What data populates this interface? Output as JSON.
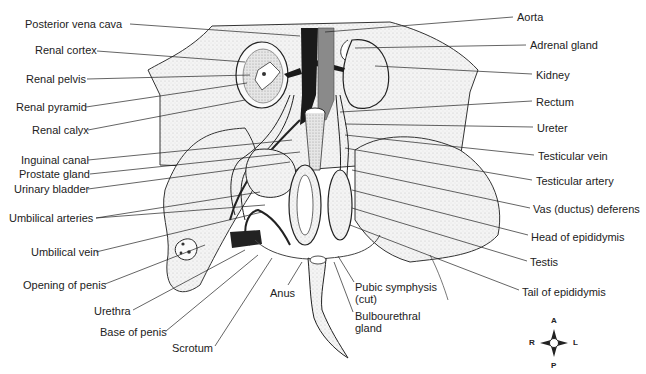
{
  "figure": {
    "labels_left": [
      {
        "id": "posterior-vena-cava",
        "text": "Posterior vena cava",
        "x": 25,
        "y": 18,
        "lx": 130,
        "ly": 24,
        "tx": 300,
        "ty": 36
      },
      {
        "id": "renal-cortex",
        "text": "Renal cortex",
        "x": 35,
        "y": 44,
        "lx": 97,
        "ly": 51,
        "tx": 245,
        "ty": 62
      },
      {
        "id": "renal-pelvis",
        "text": "Renal pelvis",
        "x": 26,
        "y": 73,
        "lx": 87,
        "ly": 79,
        "tx": 250,
        "ty": 75
      },
      {
        "id": "renal-pyramid",
        "text": "Renal pyramid",
        "x": 16,
        "y": 101,
        "lx": 86,
        "ly": 107,
        "tx": 247,
        "ty": 83
      },
      {
        "id": "renal-calyx",
        "text": "Renal calyx",
        "x": 32,
        "y": 124,
        "lx": 88,
        "ly": 130,
        "tx": 245,
        "ty": 100
      },
      {
        "id": "inguinal-canal",
        "text": "Inguinal canal",
        "x": 21,
        "y": 154,
        "lx": 88,
        "ly": 160,
        "tx": 292,
        "ty": 140
      },
      {
        "id": "prostate-gland",
        "text": "Prostate gland",
        "x": 19,
        "y": 168,
        "lx": 90,
        "ly": 174,
        "tx": 300,
        "ty": 152
      },
      {
        "id": "urinary-bladder",
        "text": "Urinary bladder",
        "x": 14,
        "y": 183,
        "lx": 88,
        "ly": 189,
        "tx": 290,
        "ty": 162
      },
      {
        "id": "umbilical-arteries",
        "text": "Umbilical arteries",
        "x": 9,
        "y": 212,
        "lx": 96,
        "ly": 218,
        "tx": 260,
        "ty": 192,
        "tx2": 265,
        "ty2": 205
      },
      {
        "id": "umbilical-vein",
        "text": "Umbilical vein",
        "x": 31,
        "y": 246,
        "lx": 96,
        "ly": 252,
        "tx": 262,
        "ty": 212
      },
      {
        "id": "opening-of-penis",
        "text": "Opening of penis",
        "x": 23,
        "y": 279,
        "lx": 105,
        "ly": 284,
        "tx": 205,
        "ty": 245
      },
      {
        "id": "urethra",
        "text": "Urethra",
        "x": 94,
        "y": 305,
        "lx": 133,
        "ly": 310,
        "tx": 245,
        "ty": 250
      },
      {
        "id": "base-of-penis",
        "text": "Base of penis",
        "x": 100,
        "y": 326,
        "lx": 166,
        "ly": 331,
        "tx": 258,
        "ty": 255
      },
      {
        "id": "scrotum",
        "text": "Scrotum",
        "x": 172,
        "y": 342,
        "lx": 215,
        "ly": 346,
        "tx": 272,
        "ty": 258
      }
    ],
    "labels_center": [
      {
        "id": "anus",
        "text": "Anus",
        "x": 270,
        "y": 287,
        "lx": 288,
        "ly": 285,
        "tx": 302,
        "ty": 262
      },
      {
        "id": "pubic-symphysis",
        "text": "Pubic symphysis\n(cut)",
        "x": 355,
        "y": 281,
        "lx": 354,
        "ly": 282,
        "tx": 338,
        "ty": 256
      },
      {
        "id": "bulbourethral-gland",
        "text": "Bulbourethral\ngland",
        "x": 355,
        "y": 310,
        "lx": 353,
        "ly": 312,
        "tx": 334,
        "ty": 262
      }
    ],
    "labels_right": [
      {
        "id": "aorta",
        "text": "Aorta",
        "x": 517,
        "y": 11,
        "lx": 513,
        "ly": 17,
        "tx": 325,
        "ty": 32
      },
      {
        "id": "adrenal-gland",
        "text": "Adrenal gland",
        "x": 530,
        "y": 39,
        "lx": 526,
        "ly": 45,
        "tx": 355,
        "ty": 48
      },
      {
        "id": "kidney",
        "text": "Kidney",
        "x": 536,
        "y": 69,
        "lx": 532,
        "ly": 74,
        "tx": 375,
        "ty": 66
      },
      {
        "id": "rectum",
        "text": "Rectum",
        "x": 536,
        "y": 96,
        "lx": 532,
        "ly": 101,
        "tx": 340,
        "ty": 112
      },
      {
        "id": "ureter",
        "text": "Ureter",
        "x": 537,
        "y": 122,
        "lx": 533,
        "ly": 127,
        "tx": 345,
        "ty": 124
      },
      {
        "id": "testicular-vein",
        "text": "Testicular vein",
        "x": 538,
        "y": 150,
        "lx": 534,
        "ly": 155,
        "tx": 345,
        "ty": 135
      },
      {
        "id": "testicular-artery",
        "text": "Testicular artery",
        "x": 536,
        "y": 175,
        "lx": 532,
        "ly": 180,
        "tx": 345,
        "ty": 148
      },
      {
        "id": "vas-deferens",
        "text": "Vas (ductus) deferens",
        "x": 533,
        "y": 203,
        "lx": 530,
        "ly": 208,
        "tx": 352,
        "ty": 170
      },
      {
        "id": "head-of-epididymis",
        "text": "Head of epididymis",
        "x": 531,
        "y": 231,
        "lx": 528,
        "ly": 235,
        "tx": 352,
        "ty": 190
      },
      {
        "id": "testis",
        "text": "Testis",
        "x": 530,
        "y": 256,
        "lx": 527,
        "ly": 261,
        "tx": 352,
        "ty": 208
      },
      {
        "id": "tail-of-epididymis",
        "text": "Tail of epididymis",
        "x": 522,
        "y": 286,
        "lx": 519,
        "ly": 290,
        "tx": 350,
        "ty": 225
      }
    ],
    "compass": {
      "A": "A",
      "P": "P",
      "R": "R",
      "L": "L",
      "cx": 554,
      "cy": 343
    }
  }
}
